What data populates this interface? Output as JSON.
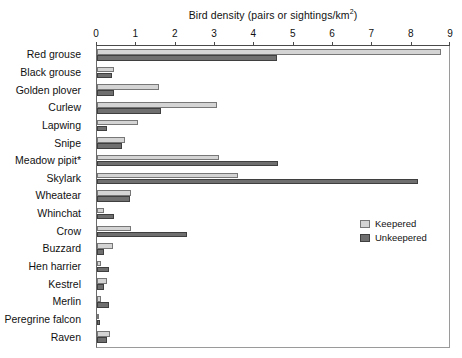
{
  "chart_data": {
    "type": "bar",
    "orientation": "horizontal",
    "title": "Bird density (pairs or sightings/km",
    "title_superscript": "2",
    "title_suffix": ")",
    "title_full": "Bird density (pairs or sightings/km2)",
    "xlabel": "Bird density (pairs or sightings/km2)",
    "ylabel": "",
    "xlim": [
      0,
      9
    ],
    "xticks": [
      0,
      1,
      2,
      3,
      4,
      5,
      6,
      7,
      8,
      9
    ],
    "xtick_labels": [
      "0",
      "1",
      "2",
      "3",
      "4",
      "5",
      "6",
      "7",
      "8",
      "9"
    ],
    "grid": false,
    "legend_position": "right-middle",
    "categories": [
      "Red grouse",
      "Black grouse",
      "Golden plover",
      "Curlew",
      "Lapwing",
      "Snipe",
      "Meadow pipit*",
      "Skylark",
      "Wheatear",
      "Whinchat",
      "Crow",
      "Buzzard",
      "Hen harrier",
      "Kestrel",
      "Merlin",
      "Peregrine falcon",
      "Raven"
    ],
    "series": [
      {
        "name": "Keepered",
        "color": "#d4d4d4",
        "values": [
          8.8,
          0.43,
          1.58,
          3.08,
          1.05,
          0.72,
          3.11,
          3.6,
          0.87,
          0.19,
          0.87,
          0.4,
          0.09,
          0.25,
          0.09,
          0.05,
          0.32
        ]
      },
      {
        "name": "Unkeepered",
        "color": "#6f6f6f",
        "values": [
          4.6,
          0.38,
          0.43,
          1.63,
          0.25,
          0.64,
          4.64,
          8.2,
          0.85,
          0.43,
          2.3,
          0.17,
          0.3,
          0.17,
          0.3,
          0.07,
          0.25
        ]
      }
    ]
  },
  "legend": {
    "items": [
      {
        "label": "Keepered"
      },
      {
        "label": "Unkeepered"
      }
    ]
  }
}
